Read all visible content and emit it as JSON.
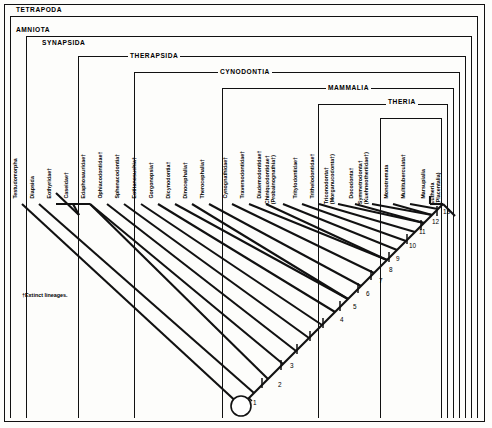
{
  "figure": {
    "type": "cladogram",
    "footnote": "†Extinct lineages.",
    "root_marker": "open-circle"
  },
  "clades": [
    {
      "name": "TETRAPODA",
      "label": "TETRAPODA"
    },
    {
      "name": "AMNIOTA",
      "label": "AMNIOTA"
    },
    {
      "name": "SYNAPSIDA",
      "label": "SYNAPSIDA"
    },
    {
      "name": "THERAPSIDA",
      "label": "THERAPSIDA"
    },
    {
      "name": "CYNODONTIA",
      "label": "CYNODONTIA"
    },
    {
      "name": "MAMMALIA",
      "label": "MAMMALIA"
    },
    {
      "name": "THERIA",
      "label": "THERIA"
    }
  ],
  "taxa": [
    {
      "line1": "Testudomorpha",
      "line2": ""
    },
    {
      "line1": "Diapsida",
      "line2": ""
    },
    {
      "line1": "Eothyridae†",
      "line2": ""
    },
    {
      "line1": "Caseidae†",
      "line2": ""
    },
    {
      "line1": "Edaphosauridae†",
      "line2": ""
    },
    {
      "line1": "Ophiacodontidae†",
      "line2": ""
    },
    {
      "line1": "Sphenacodontia†",
      "line2": ""
    },
    {
      "line1": "Eotitanosuchia†",
      "line2": ""
    },
    {
      "line1": "Gorgonopsia†",
      "line2": ""
    },
    {
      "line1": "Dicynodontia†",
      "line2": ""
    },
    {
      "line1": "Dinocephalia†",
      "line2": ""
    },
    {
      "line1": "Therocephalia†",
      "line2": ""
    },
    {
      "line1": "Cynognathidae†",
      "line2": ""
    },
    {
      "line1": "Traversodontidae†",
      "line2": ""
    },
    {
      "line1": "Diademodontidae†",
      "line2": ""
    },
    {
      "line1": "Chiniquodontidae†",
      "line2": "(Probainognathia†)"
    },
    {
      "line1": "Tritylodontidae†",
      "line2": ""
    },
    {
      "line1": "Trithelodontidae†",
      "line2": ""
    },
    {
      "line1": "Triconodonta†",
      "line2": "(Morganucodonta†)"
    },
    {
      "line1": "Docodonta†",
      "line2": ""
    },
    {
      "line1": "Symmetrodonta†",
      "line2": "(Kuehneotheriidae†)"
    },
    {
      "line1": "Monotremata",
      "line2": ""
    },
    {
      "line1": "Multituberculata†",
      "line2": ""
    },
    {
      "line1": "Marsupialia",
      "line2": ""
    },
    {
      "line1": "Eutheria",
      "line2": "(Placentalia)"
    }
  ],
  "nodes": [
    {
      "id": "1",
      "label": "1"
    },
    {
      "id": "2",
      "label": "2"
    },
    {
      "id": "3",
      "label": "3"
    },
    {
      "id": "4",
      "label": "4"
    },
    {
      "id": "5",
      "label": "5"
    },
    {
      "id": "6",
      "label": "6"
    },
    {
      "id": "7",
      "label": "7"
    },
    {
      "id": "8",
      "label": "8"
    },
    {
      "id": "9",
      "label": "9"
    },
    {
      "id": "10",
      "label": "10"
    },
    {
      "id": "11",
      "label": "11"
    },
    {
      "id": "12",
      "label": "12"
    },
    {
      "id": "13",
      "label": "13"
    }
  ],
  "colors": {
    "ink": "#111111",
    "paper": "#fdfdfb"
  }
}
